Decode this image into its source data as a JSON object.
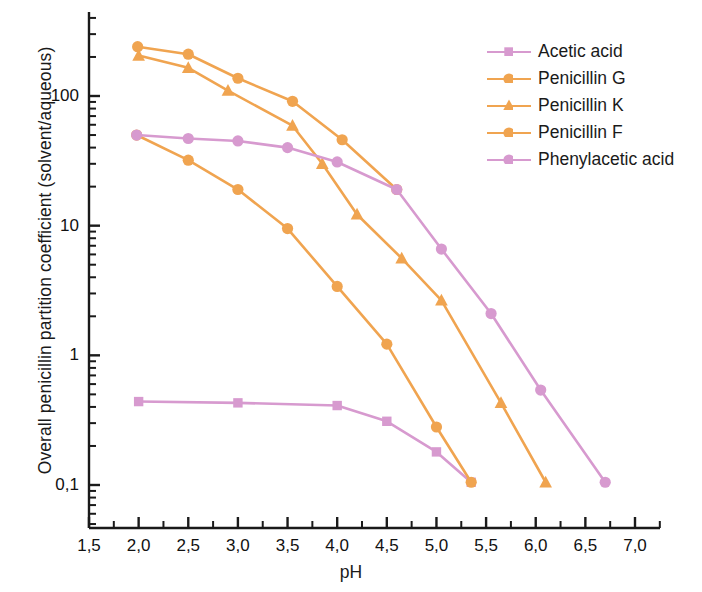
{
  "chart_data": {
    "type": "line",
    "title": "",
    "xlabel": "pH",
    "ylabel": "Overall penicillin partition coefficient (solvent/aqueous)",
    "xlim": [
      1.5,
      7.15
    ],
    "ylim": [
      0.08,
      400
    ],
    "yscale": "log",
    "xscale": "linear",
    "grid": false,
    "legend_position": "upper right",
    "decimal_separator": ",",
    "x_ticks": [
      1.5,
      2.0,
      2.5,
      3.0,
      3.5,
      4.0,
      4.5,
      5.0,
      5.5,
      6.0,
      6.5,
      7.0
    ],
    "x_tick_labels": [
      "1,5",
      "2,0",
      "2,5",
      "3,0",
      "3,5",
      "4,0",
      "4,5",
      "5,0",
      "5,5",
      "6,0",
      "6,5",
      "7,0"
    ],
    "y_ticks": [
      0.1,
      1,
      10,
      100
    ],
    "y_tick_labels": [
      "0,1",
      "1",
      "10",
      "100"
    ],
    "colors": {
      "orange": "#F0A450",
      "pink": "#D79ACF",
      "axis": "#1a1a1a"
    },
    "series": [
      {
        "name": "Acetic acid",
        "color": "#D79ACF",
        "marker": "square",
        "x": [
          2.0,
          3.0,
          4.0,
          4.5,
          5.0,
          5.35
        ],
        "y": [
          0.44,
          0.43,
          0.41,
          0.31,
          0.18,
          0.105
        ]
      },
      {
        "name": "Penicillin G",
        "color": "#F0A450",
        "marker": "circle",
        "x": [
          1.99,
          2.5,
          3.0,
          3.55,
          4.05,
          4.6
        ],
        "y": [
          240,
          210,
          137,
          91,
          46,
          19
        ]
      },
      {
        "name": "Penicillin K",
        "color": "#F0A450",
        "marker": "triangle",
        "x": [
          2.0,
          2.5,
          2.9,
          3.55,
          3.85,
          4.2,
          4.65,
          5.05,
          5.65,
          6.1
        ],
        "y": [
          205,
          165,
          110,
          59,
          30,
          12.2,
          5.6,
          2.65,
          0.43,
          0.105
        ]
      },
      {
        "name": "Penicillin F",
        "color": "#F0A450",
        "marker": "circle",
        "x": [
          1.98,
          2.5,
          3.0,
          3.5,
          4.0,
          4.5,
          5.0,
          5.35
        ],
        "y": [
          50,
          32,
          19,
          9.5,
          3.4,
          1.22,
          0.28,
          0.105
        ]
      },
      {
        "name": "Phenylacetic acid",
        "color": "#D79ACF",
        "marker": "circle",
        "x": [
          1.98,
          2.5,
          3.0,
          3.5,
          4.0,
          4.6,
          5.05,
          5.55,
          6.05,
          6.7
        ],
        "y": [
          50,
          47,
          45,
          40,
          31,
          19,
          6.6,
          2.1,
          0.54,
          0.105
        ]
      }
    ]
  },
  "legend": {
    "items": [
      {
        "label": "Acetic acid",
        "color": "#D79ACF",
        "marker": "square"
      },
      {
        "label": "Penicillin G",
        "color": "#F0A450",
        "marker": "circle"
      },
      {
        "label": "Penicillin K",
        "color": "#F0A450",
        "marker": "triangle"
      },
      {
        "label": "Penicillin F",
        "color": "#F0A450",
        "marker": "circle"
      },
      {
        "label": "Phenylacetic acid",
        "color": "#D79ACF",
        "marker": "circle"
      }
    ]
  }
}
